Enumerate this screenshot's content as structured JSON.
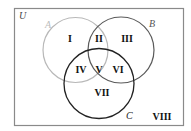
{
  "diagram": {
    "type": "venn-3-set",
    "universe": {
      "label": "U",
      "color": "#444444"
    },
    "sets": [
      {
        "label": "A",
        "color": "#b5b5b5"
      },
      {
        "label": "B",
        "color": "#555555"
      },
      {
        "label": "C",
        "color": "#222222"
      }
    ],
    "regions": [
      {
        "label": "I",
        "description": "A only"
      },
      {
        "label": "II",
        "description": "A and B, not C"
      },
      {
        "label": "III",
        "description": "B only"
      },
      {
        "label": "IV",
        "description": "A and C, not B"
      },
      {
        "label": "V",
        "description": "A and B and C"
      },
      {
        "label": "VI",
        "description": "B and C, not A"
      },
      {
        "label": "VII",
        "description": "C only"
      },
      {
        "label": "VIII",
        "description": "outside A, B, and C"
      }
    ]
  }
}
